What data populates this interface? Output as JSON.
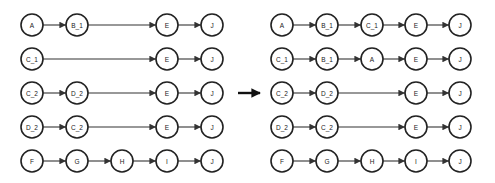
{
  "diagram": {
    "left": {
      "columns_x": [
        32,
        77,
        122,
        167,
        212
      ],
      "rows": [
        {
          "nodes": [
            {
              "label": "A",
              "col": 0
            },
            {
              "label": "B_1",
              "col": 1
            },
            {
              "label": "E",
              "col": 3
            },
            {
              "label": "J",
              "col": 4
            }
          ]
        },
        {
          "nodes": [
            {
              "label": "C_1",
              "col": 0
            },
            {
              "label": "E",
              "col": 3
            },
            {
              "label": "J",
              "col": 4
            }
          ]
        },
        {
          "nodes": [
            {
              "label": "C_2",
              "col": 0
            },
            {
              "label": "D_2",
              "col": 1
            },
            {
              "label": "E",
              "col": 3
            },
            {
              "label": "J",
              "col": 4
            }
          ]
        },
        {
          "nodes": [
            {
              "label": "D_2",
              "col": 0
            },
            {
              "label": "C_2",
              "col": 1
            },
            {
              "label": "E",
              "col": 3
            },
            {
              "label": "J",
              "col": 4
            }
          ]
        },
        {
          "nodes": [
            {
              "label": "F",
              "col": 0
            },
            {
              "label": "G",
              "col": 1
            },
            {
              "label": "H",
              "col": 2
            },
            {
              "label": "I",
              "col": 3
            },
            {
              "label": "J",
              "col": 4
            }
          ]
        }
      ]
    },
    "right": {
      "columns_x": [
        282,
        327,
        372,
        416,
        460
      ],
      "rows": [
        {
          "nodes": [
            {
              "label": "A",
              "col": 0
            },
            {
              "label": "B_1",
              "col": 1
            },
            {
              "label": "C_1",
              "col": 2
            },
            {
              "label": "E",
              "col": 3
            },
            {
              "label": "J",
              "col": 4
            }
          ]
        },
        {
          "nodes": [
            {
              "label": "C_1",
              "col": 0
            },
            {
              "label": "B_1",
              "col": 1
            },
            {
              "label": "A",
              "col": 2
            },
            {
              "label": "E",
              "col": 3
            },
            {
              "label": "J",
              "col": 4
            }
          ]
        },
        {
          "nodes": [
            {
              "label": "C_2",
              "col": 0
            },
            {
              "label": "D_2",
              "col": 1
            },
            {
              "label": "E",
              "col": 3
            },
            {
              "label": "J",
              "col": 4
            }
          ]
        },
        {
          "nodes": [
            {
              "label": "D_2",
              "col": 0
            },
            {
              "label": "C_2",
              "col": 1
            },
            {
              "label": "E",
              "col": 3
            },
            {
              "label": "J",
              "col": 4
            }
          ]
        },
        {
          "nodes": [
            {
              "label": "F",
              "col": 0
            },
            {
              "label": "G",
              "col": 1
            },
            {
              "label": "H",
              "col": 2
            },
            {
              "label": "I",
              "col": 3
            },
            {
              "label": "J",
              "col": 4
            }
          ]
        }
      ]
    },
    "rows_y": [
      25,
      59,
      93,
      127,
      161
    ],
    "node_radius": 11,
    "transform_arrow": {
      "x1": 238,
      "x2": 260,
      "y": 93
    },
    "colors": {
      "stroke": "#222222",
      "background": "#ffffff"
    }
  }
}
